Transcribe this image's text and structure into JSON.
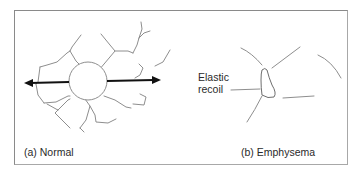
{
  "figure": {
    "panels": [
      {
        "id": "a",
        "label": "(a) Normal",
        "description": "Alveolus with radiating elastic fibers under tension",
        "annotation": {
          "line1": "Elastic",
          "line2": "recoil"
        }
      },
      {
        "id": "b",
        "label": "(b) Emphysema",
        "description": "Collapsed airway with broken, sparse elastic fibers"
      }
    ],
    "colors": {
      "fiber": "#8e8e8e",
      "arrow": "#111111",
      "frame": "#8a8a8a",
      "text": "#2a2a2a"
    }
  }
}
